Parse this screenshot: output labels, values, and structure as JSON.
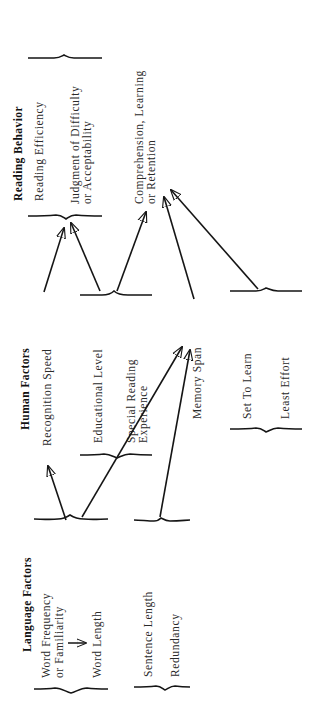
{
  "diagram": {
    "columns": [
      {
        "id": "language",
        "header": "Language Factors",
        "groups": [
          {
            "id": "word",
            "items": [
              "Word Frequency or Familiarity",
              "Word Length"
            ],
            "lines": [
              [
                "Word Frequency",
                "or Familiarity"
              ],
              [
                "Word Length"
              ]
            ]
          },
          {
            "id": "sentence",
            "items": [
              "Sentence Length",
              "Redundancy"
            ]
          }
        ]
      },
      {
        "id": "human",
        "header": "Human Factors",
        "items": [
          "Recognition Speed",
          "Educational Level",
          "Special Reading Experience",
          "Memory Span",
          "Set To Learn",
          "Least Effort"
        ],
        "groups": [
          {
            "id": "recognition",
            "items": [
              "Recognition Speed"
            ]
          },
          {
            "id": "education",
            "items": [
              "Educational Level",
              "Special Reading Experience"
            ],
            "lines": [
              [
                "Educational Level"
              ],
              [
                "Special Reading",
                "Experience"
              ]
            ]
          },
          {
            "id": "memory",
            "items": [
              "Memory Span"
            ]
          },
          {
            "id": "motivation",
            "items": [
              "Set To Learn",
              "Least Effort"
            ]
          }
        ]
      },
      {
        "id": "behavior",
        "header": "Reading Behavior",
        "groups": [
          {
            "id": "efficiency",
            "items": [
              "Reading Efficiency",
              "Judgment of Difficulty or Acceptability"
            ],
            "lines": [
              [
                "Reading Efficiency"
              ],
              [
                "Judgment of Difficulty",
                "or Acceptability"
              ]
            ]
          },
          {
            "id": "comprehension",
            "items": [
              "Comprehension, Learning or Retention"
            ],
            "lines": [
              [
                "Comprehension, Learning",
                "or Retention"
              ]
            ]
          }
        ]
      }
    ],
    "edges": [
      {
        "from": "Word Frequency or Familiarity",
        "to": "Word Length"
      },
      {
        "from": "Word Frequency or Familiarity / Word Length",
        "to": "Recognition Speed"
      },
      {
        "from": "Word Frequency or Familiarity / Word Length",
        "to": "Memory Span"
      },
      {
        "from": "Sentence Length / Redundancy",
        "to": "Memory Span"
      },
      {
        "from": "Recognition Speed",
        "to": "Reading Efficiency / Judgment of Difficulty or Acceptability"
      },
      {
        "from": "Educational Level / Special Reading Experience",
        "to": "Reading Efficiency / Judgment of Difficulty or Acceptability"
      },
      {
        "from": "Educational Level / Special Reading Experience",
        "to": "Comprehension, Learning or Retention"
      },
      {
        "from": "Memory Span",
        "to": "Comprehension, Learning or Retention"
      },
      {
        "from": "Set To Learn / Least Effort",
        "to": "Comprehension, Learning or Retention"
      }
    ]
  }
}
